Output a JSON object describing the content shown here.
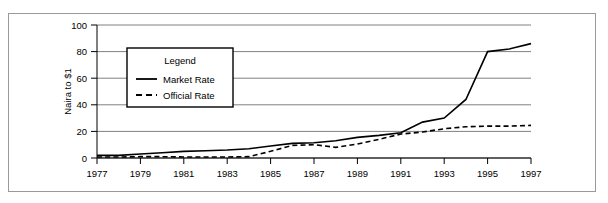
{
  "chart_data": {
    "type": "line",
    "title": "",
    "xlabel": "",
    "ylabel": "Naira to $1",
    "xlim": [
      1977,
      1997
    ],
    "ylim": [
      0,
      100
    ],
    "grid": true,
    "grid_axis": "y",
    "legend": {
      "title": "Legend",
      "position": "upper-left-inside",
      "entries": [
        {
          "name": "Market Rate",
          "style": "solid"
        },
        {
          "name": "Official Rate",
          "style": "dashed"
        }
      ]
    },
    "x": [
      1977,
      1978,
      1979,
      1980,
      1981,
      1982,
      1983,
      1984,
      1985,
      1986,
      1987,
      1988,
      1989,
      1990,
      1991,
      1992,
      1993,
      1994,
      1995,
      1996,
      1997
    ],
    "xticks": [
      1977,
      1979,
      1981,
      1983,
      1985,
      1987,
      1989,
      1991,
      1993,
      1995,
      1997
    ],
    "xtick_labels": [
      "1977",
      "1979",
      "1981",
      "1983",
      "1985",
      "1987",
      "1989",
      "1991",
      "1993",
      "1995",
      "1997"
    ],
    "yticks": [
      0,
      20,
      40,
      60,
      80,
      100
    ],
    "ytick_labels": [
      "0",
      "20",
      "40",
      "60",
      "80",
      "100"
    ],
    "series": [
      {
        "name": "Market Rate",
        "style": "solid",
        "color": "#000000",
        "values": [
          2,
          2,
          3,
          4,
          5,
          5.5,
          6,
          7,
          9,
          11,
          11.5,
          13,
          15.5,
          17,
          19,
          27,
          30,
          44,
          80,
          82,
          86
        ]
      },
      {
        "name": "Official Rate",
        "style": "dashed",
        "color": "#000000",
        "values": [
          0.7,
          0.7,
          1,
          1,
          0.8,
          0.7,
          0.8,
          1,
          5,
          9.5,
          10,
          8,
          10.5,
          14,
          18,
          19.5,
          22,
          23.5,
          24,
          24,
          24.5
        ]
      }
    ]
  },
  "colors": {
    "frame": "#9a9a9a",
    "axis": "#000000",
    "gridline": "#808080",
    "background": "#ffffff"
  }
}
